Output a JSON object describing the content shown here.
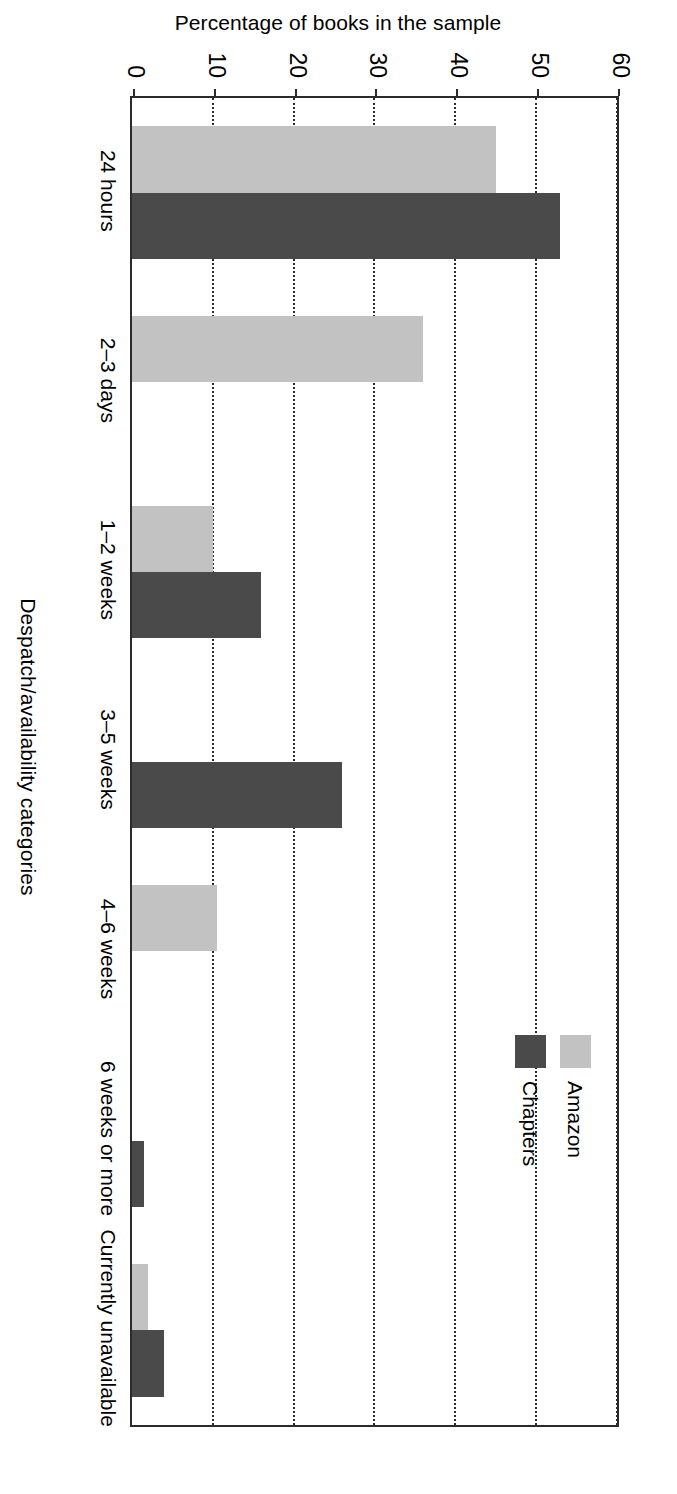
{
  "chart_data": {
    "type": "bar",
    "orientation": "vertical",
    "title": "",
    "xlabel": "Despatch/availability categories",
    "ylabel": "Percentage of books in the sample",
    "ylim": [
      0,
      60
    ],
    "yticks": [
      0,
      10,
      20,
      30,
      40,
      50,
      60
    ],
    "ytick_labels": [
      "0",
      "10",
      "20",
      "30",
      "40",
      "50",
      "60"
    ],
    "grid": "dotted vertical gridlines at each y tick (chart printed sideways)",
    "legend_position": "upper right inside plot area",
    "categories": [
      "24 hours",
      "2–3 days",
      "1–2 weeks",
      "3–5 weeks",
      "4–6 weeks",
      "6 weeks or more",
      "Currently unavailable"
    ],
    "series": [
      {
        "name": "Amazon",
        "color": "#c2c2c2",
        "values": [
          45,
          36,
          10,
          0,
          10.5,
          0,
          2
        ]
      },
      {
        "name": "Chapters",
        "color": "#4a4a4a",
        "values": [
          53,
          0,
          16,
          26,
          0,
          1.5,
          4
        ]
      }
    ]
  },
  "legend": {
    "items": [
      {
        "label": "Amazon",
        "swatch": "amazon"
      },
      {
        "label": "Chapters",
        "swatch": "chapters"
      }
    ]
  },
  "colors": {
    "amazon": "#c2c2c2",
    "chapters": "#4a4a4a",
    "axis": "#2b2b2b",
    "background": "#ffffff"
  }
}
